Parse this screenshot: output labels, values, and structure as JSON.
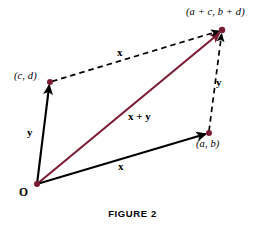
{
  "figure": {
    "caption": "FIGURE 2",
    "colors": {
      "resultant_vector": "#7B1B32",
      "point_dot": "#7B1B32",
      "solid_vector": "#000000",
      "dashed_vector": "#000000",
      "background": "#FFFFFF",
      "text": "#000000"
    },
    "points": [
      {
        "id": "origin",
        "label": "O",
        "x": 37,
        "y": 184,
        "label_x": 19,
        "label_y": 187,
        "has_dot": true
      },
      {
        "id": "cd",
        "label": "(c, d)",
        "x": 50,
        "y": 82,
        "label_x": 14,
        "label_y": 71,
        "has_dot": true
      },
      {
        "id": "ab",
        "label": "(a, b)",
        "x": 209,
        "y": 133,
        "label_x": 196,
        "label_y": 139,
        "has_dot": true
      },
      {
        "id": "sum",
        "label": "(a + c, b + d)",
        "x": 222,
        "y": 30,
        "label_x": 186,
        "label_y": 7,
        "has_dot": true
      }
    ],
    "vectors": [
      {
        "id": "x-bottom",
        "label": "x",
        "from": "origin",
        "to": "ab",
        "style": "solid",
        "color": "#000000",
        "label_x": 118,
        "label_y": 161
      },
      {
        "id": "y-left",
        "label": "y",
        "from": "origin",
        "to": "cd",
        "style": "solid",
        "color": "#000000",
        "label_x": 27,
        "label_y": 127
      },
      {
        "id": "x-top",
        "label": "x",
        "from": "cd",
        "to": "sum",
        "style": "dashed",
        "color": "#000000",
        "label_x": 117,
        "label_y": 47
      },
      {
        "id": "y-right",
        "label": "y",
        "from": "ab",
        "to": "sum",
        "style": "dashed",
        "color": "#000000",
        "label_x": 216,
        "label_y": 77
      },
      {
        "id": "resultant",
        "label": "x + y",
        "from": "origin",
        "to": "sum",
        "style": "solid",
        "color": "#7B1B32",
        "label_x": 128,
        "label_y": 111
      }
    ]
  }
}
